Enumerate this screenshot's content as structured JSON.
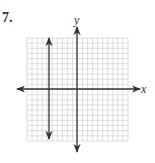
{
  "problem": {
    "number": "7."
  },
  "graph": {
    "x_label": "x",
    "y_label": "y",
    "grid": {
      "columns": 20,
      "rows": 20,
      "line_color": "#c8c8c8"
    },
    "axis_color": "#333333",
    "vertical_line": {
      "equation": "x = -3",
      "x_value": -3
    }
  },
  "chart_data": {
    "type": "line",
    "title": "",
    "xlabel": "x",
    "ylabel": "y",
    "xlim": [
      -10,
      10
    ],
    "ylim": [
      -10,
      10
    ],
    "grid": true,
    "series": [
      {
        "name": "vertical line",
        "x": [
          -3,
          -3
        ],
        "y": [
          -9,
          9
        ]
      }
    ]
  }
}
